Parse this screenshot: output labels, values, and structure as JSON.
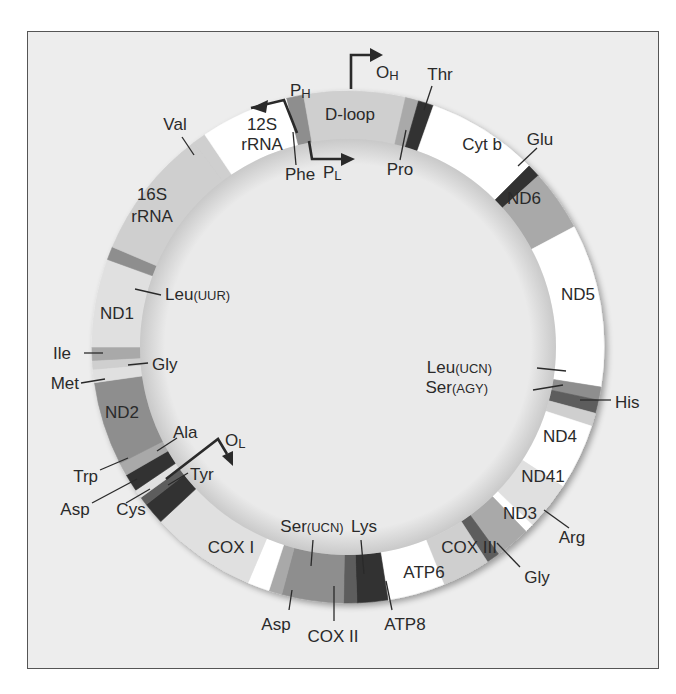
{
  "figure": {
    "center": [
      348,
      347
    ],
    "outer_radius": 256,
    "inner_radius": 208,
    "colors": {
      "frame_bg": "#ededed",
      "inner_bg": "#e9e9e9",
      "white": "#ffffff",
      "pale": "#e0e0e0",
      "light": "#cfcfcf",
      "mid": "#a9a9a9",
      "midDark": "#8e8e8e",
      "dark": "#5d5d5d",
      "darkest": "#333333",
      "line": "#2a2a2a"
    },
    "segments": [
      {
        "name": "Phe",
        "start": -14,
        "end": -10,
        "color": "midDark"
      },
      {
        "name": "D-loop",
        "start": -10,
        "end": 13,
        "color": "light"
      },
      {
        "name": "Pro",
        "start": 13,
        "end": 16,
        "color": "mid"
      },
      {
        "name": "Thr",
        "start": 16,
        "end": 19.5,
        "color": "darkest"
      },
      {
        "name": "Cyt b",
        "start": 19.5,
        "end": 45,
        "color": "white"
      },
      {
        "name": "Glu",
        "start": 45,
        "end": 48,
        "color": "darkest"
      },
      {
        "name": "ND6",
        "start": 48,
        "end": 62,
        "color": "mid"
      },
      {
        "name": "ND5",
        "start": 62,
        "end": 99,
        "color": "white"
      },
      {
        "name": "Leu(UCN)",
        "start": 99,
        "end": 102,
        "color": "midDark"
      },
      {
        "name": "Ser(AGY)",
        "start": 102,
        "end": 105,
        "color": "dark"
      },
      {
        "name": "His",
        "start": 105,
        "end": 108,
        "color": "light"
      },
      {
        "name": "ND4",
        "start": 108,
        "end": 123,
        "color": "white"
      },
      {
        "name": "ND41",
        "start": 123,
        "end": 134,
        "color": "pale"
      },
      {
        "name": "Arg",
        "start": 134,
        "end": 136,
        "color": "white"
      },
      {
        "name": "ND3",
        "start": 136,
        "end": 144,
        "color": "mid"
      },
      {
        "name": "Gly",
        "start": 144,
        "end": 147,
        "color": "dark"
      },
      {
        "name": "COX III",
        "start": 147,
        "end": 158,
        "color": "light"
      },
      {
        "name": "ATP6",
        "start": 158,
        "end": 171,
        "color": "white"
      },
      {
        "name": "ATP8",
        "start": 171,
        "end": 178,
        "color": "darkest"
      },
      {
        "name": "Lys",
        "start": 178,
        "end": 181,
        "color": "dark"
      },
      {
        "name": "COX II",
        "start": 181,
        "end": 195,
        "color": "midDark"
      },
      {
        "name": "Ser(UCN)",
        "start": 195,
        "end": 198,
        "color": "mid"
      },
      {
        "name": "Asp",
        "start": 198,
        "end": 203,
        "color": "white"
      },
      {
        "name": "COX I",
        "start": 203,
        "end": 227,
        "color": "pale"
      },
      {
        "name": "Tyr",
        "start": 227,
        "end": 232,
        "color": "darkest"
      },
      {
        "name": "Cys",
        "start": 232,
        "end": 234,
        "color": "dark"
      },
      {
        "name": "Asp",
        "start": 234,
        "end": 236,
        "color": "pale"
      },
      {
        "name": "Ala",
        "start": 236,
        "end": 240,
        "color": "darkest"
      },
      {
        "name": "Trp",
        "start": 240,
        "end": 243,
        "color": "mid"
      },
      {
        "name": "ND2",
        "start": 243,
        "end": 262,
        "color": "midDark"
      },
      {
        "name": "Met",
        "start": 262,
        "end": 265,
        "color": "pale"
      },
      {
        "name": "Gly",
        "start": 265,
        "end": 267,
        "color": "light"
      },
      {
        "name": "Ile",
        "start": 267,
        "end": 270,
        "color": "mid"
      },
      {
        "name": "ND1",
        "start": 270,
        "end": 290,
        "color": "pale"
      },
      {
        "name": "Leu(UUR)",
        "start": 290,
        "end": 293,
        "color": "midDark"
      },
      {
        "name": "16S rRNA",
        "start": 293,
        "end": 323,
        "color": "light"
      },
      {
        "name": "Val",
        "start": 323,
        "end": 326,
        "color": "light"
      },
      {
        "name": "12S rRNA",
        "start": 326,
        "end": 346,
        "color": "white"
      }
    ],
    "labels": [
      {
        "text": "12S",
        "x": 262,
        "y": 130,
        "size": 17,
        "anchor": "middle"
      },
      {
        "text": "rRNA",
        "x": 262,
        "y": 150,
        "size": 17,
        "anchor": "middle"
      },
      {
        "text": "D-loop",
        "x": 350,
        "y": 120,
        "size": 17,
        "anchor": "middle"
      },
      {
        "text": "Cyt b",
        "x": 482,
        "y": 150,
        "size": 17,
        "anchor": "middle"
      },
      {
        "text": "ND6",
        "x": 524,
        "y": 204,
        "size": 17,
        "anchor": "middle"
      },
      {
        "text": "ND5",
        "x": 578,
        "y": 300,
        "size": 17,
        "anchor": "middle"
      },
      {
        "text": "ND4",
        "x": 560,
        "y": 442,
        "size": 17,
        "anchor": "middle"
      },
      {
        "text": "ND41",
        "x": 543,
        "y": 482,
        "size": 17,
        "anchor": "middle"
      },
      {
        "text": "ND3",
        "x": 520,
        "y": 519,
        "size": 17,
        "anchor": "middle"
      },
      {
        "text": "COX III",
        "x": 469,
        "y": 553,
        "size": 17,
        "anchor": "middle"
      },
      {
        "text": "ATP6",
        "x": 424,
        "y": 578,
        "size": 17,
        "anchor": "middle"
      },
      {
        "text": "COX I",
        "x": 231,
        "y": 553,
        "size": 17,
        "anchor": "middle"
      },
      {
        "text": "ND2",
        "x": 122,
        "y": 418,
        "size": 17,
        "anchor": "middle"
      },
      {
        "text": "ND1",
        "x": 117,
        "y": 319,
        "size": 17,
        "anchor": "middle"
      },
      {
        "text": "16S",
        "x": 152,
        "y": 200,
        "size": 17,
        "anchor": "middle"
      },
      {
        "text": "rRNA",
        "x": 152,
        "y": 222,
        "size": 17,
        "anchor": "middle"
      }
    ],
    "callouts": [
      {
        "text": "Val",
        "tx": 175,
        "ty": 130,
        "x1": 182,
        "y1": 137,
        "x2": 194,
        "y2": 155,
        "anchor": "middle"
      },
      {
        "text": "Phe",
        "tx": 300,
        "ty": 180,
        "x1": 296,
        "y1": 165,
        "x2": 293,
        "y2": 132,
        "anchor": "middle"
      },
      {
        "text": "Pro",
        "tx": 400,
        "ty": 175,
        "x1": 400,
        "y1": 160,
        "x2": 406,
        "y2": 130,
        "anchor": "middle"
      },
      {
        "text": "Thr",
        "tx": 440,
        "ty": 80,
        "x1": 432,
        "y1": 86,
        "x2": 424,
        "y2": 110,
        "anchor": "middle"
      },
      {
        "text": "Glu",
        "tx": 540,
        "ty": 145,
        "x1": 537,
        "y1": 148,
        "x2": 518,
        "y2": 166,
        "anchor": "middle"
      },
      {
        "text": "Leu(UUR)",
        "tx": 165,
        "ty": 300,
        "x1": 161,
        "y1": 295,
        "x2": 135,
        "y2": 289,
        "anchor": "start"
      },
      {
        "text": "Ile",
        "tx": 71,
        "ty": 359,
        "x1": 84,
        "y1": 353,
        "x2": 103,
        "y2": 353,
        "anchor": "end"
      },
      {
        "text": "Gly",
        "tx": 152,
        "ty": 370,
        "x1": 148,
        "y1": 363,
        "x2": 128,
        "y2": 365,
        "anchor": "start"
      },
      {
        "text": "Met",
        "tx": 79,
        "ty": 389,
        "x1": 81,
        "y1": 383,
        "x2": 105,
        "y2": 379,
        "anchor": "end"
      },
      {
        "text": "Ala",
        "tx": 173,
        "ty": 438,
        "x1": 177,
        "y1": 438,
        "x2": 157,
        "y2": 451,
        "anchor": "start"
      },
      {
        "text": "Trp",
        "tx": 98,
        "ty": 482,
        "x1": 100,
        "y1": 470,
        "x2": 128,
        "y2": 458,
        "anchor": "end"
      },
      {
        "text": "Tyr",
        "tx": 190,
        "ty": 480,
        "x1": 188,
        "y1": 473,
        "x2": 168,
        "y2": 485,
        "anchor": "start"
      },
      {
        "text": "Asp",
        "tx": 75,
        "ty": 515,
        "x1": 92,
        "y1": 503,
        "x2": 137,
        "y2": 479,
        "anchor": "middle"
      },
      {
        "text": "Cys",
        "tx": 131,
        "ty": 515,
        "x1": 126,
        "y1": 503,
        "x2": 150,
        "y2": 489,
        "anchor": "middle"
      },
      {
        "text": "Ser(UCN)",
        "tx": 312,
        "ty": 532,
        "x1": 313,
        "y1": 540,
        "x2": 311,
        "y2": 566,
        "anchor": "middle"
      },
      {
        "text": "Lys",
        "tx": 364,
        "ty": 532,
        "x1": 361,
        "y1": 540,
        "x2": 364,
        "y2": 574,
        "anchor": "middle"
      },
      {
        "text": "Asp",
        "tx": 276,
        "ty": 630,
        "x1": 289,
        "y1": 610,
        "x2": 292,
        "y2": 590,
        "anchor": "middle"
      },
      {
        "text": "COX II",
        "tx": 333,
        "ty": 642,
        "x1": 334,
        "y1": 621,
        "x2": 334,
        "y2": 586,
        "anchor": "middle"
      },
      {
        "text": "ATP8",
        "tx": 405,
        "ty": 630,
        "x1": 392,
        "y1": 610,
        "x2": 386,
        "y2": 581,
        "anchor": "middle"
      },
      {
        "text": "Leu(UCN)",
        "tx": 492,
        "ty": 373,
        "x1": 537,
        "y1": 368,
        "x2": 566,
        "y2": 371,
        "anchor": "end"
      },
      {
        "text": "Ser(AGY)",
        "tx": 488,
        "ty": 393,
        "x1": 533,
        "y1": 390,
        "x2": 563,
        "y2": 385,
        "anchor": "end"
      },
      {
        "text": "His",
        "tx": 615,
        "ty": 408,
        "x1": 611,
        "y1": 400,
        "x2": 580,
        "y2": 400,
        "anchor": "start"
      },
      {
        "text": "Arg",
        "tx": 572,
        "ty": 543,
        "x1": 569,
        "y1": 528,
        "x2": 544,
        "y2": 510,
        "anchor": "middle"
      },
      {
        "text": "Gly",
        "tx": 537,
        "ty": 583,
        "x1": 520,
        "y1": 567,
        "x2": 497,
        "y2": 543,
        "anchor": "middle"
      }
    ],
    "promoters": [
      {
        "label": "P",
        "sub": "H",
        "lx": 290,
        "ly": 96,
        "path": "M 297 133 L 284 100 L 251 108",
        "head": [
          251,
          108,
          268,
          100,
          266,
          113
        ]
      },
      {
        "label": "O",
        "sub": "H",
        "lx": 376,
        "ly": 78,
        "path": "M 351 89 L 351 55 L 374 55",
        "head": [
          383,
          55,
          370,
          48,
          370,
          62
        ]
      },
      {
        "label": "P",
        "sub": "L",
        "lx": 323,
        "ly": 178,
        "path": "M 309 141 L 312 159 L 346 159",
        "head": [
          355,
          159,
          341,
          153,
          341,
          166
        ]
      },
      {
        "label": "O",
        "sub": "L",
        "lx": 225,
        "ly": 446,
        "path": "M 166 479 L 218 439 L 227 454",
        "head": [
          233,
          466,
          222,
          456,
          233,
          451
        ]
      }
    ]
  }
}
